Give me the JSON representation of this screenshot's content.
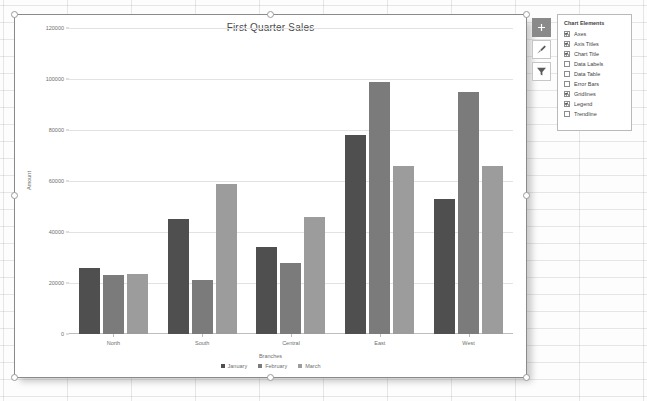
{
  "chart": {
    "title": "First Quarter Sales"
  },
  "chart_data": {
    "type": "bar",
    "title": "First Quarter Sales",
    "xlabel": "Branches",
    "ylabel": "Amount",
    "categories": [
      "North",
      "South",
      "Central",
      "East",
      "West"
    ],
    "series": [
      {
        "name": "January",
        "color": "#4f4f4f",
        "values": [
          26000,
          45000,
          34000,
          78000,
          53000
        ]
      },
      {
        "name": "February",
        "color": "#7b7b7b",
        "values": [
          23000,
          21000,
          28000,
          99000,
          95000
        ]
      },
      {
        "name": "March",
        "color": "#9c9c9c",
        "values": [
          23500,
          59000,
          46000,
          66000,
          66000
        ]
      }
    ],
    "ylim": [
      0,
      120000
    ],
    "yticks": [
      0,
      20000,
      40000,
      60000,
      80000,
      100000,
      120000
    ],
    "ytick_labels": [
      "0",
      "20000",
      "40000",
      "60000",
      "80000",
      "100000",
      "120000"
    ],
    "grid": true,
    "legend_position": "bottom"
  },
  "chart_buttons": [
    {
      "name": "chart-elements",
      "icon": "plus-icon",
      "active": true
    },
    {
      "name": "chart-styles",
      "icon": "brush-icon",
      "active": false
    },
    {
      "name": "chart-filters",
      "icon": "funnel-icon",
      "active": false
    }
  ],
  "chart_elements_panel": {
    "title": "Chart Elements",
    "items": [
      {
        "label": "Axes",
        "checked": true
      },
      {
        "label": "Axis Titles",
        "checked": true
      },
      {
        "label": "Chart Title",
        "checked": true
      },
      {
        "label": "Data Labels",
        "checked": false
      },
      {
        "label": "Data Table",
        "checked": false
      },
      {
        "label": "Error Bars",
        "checked": false
      },
      {
        "label": "Gridlines",
        "checked": true
      },
      {
        "label": "Legend",
        "checked": true
      },
      {
        "label": "Trendline",
        "checked": false
      }
    ]
  }
}
